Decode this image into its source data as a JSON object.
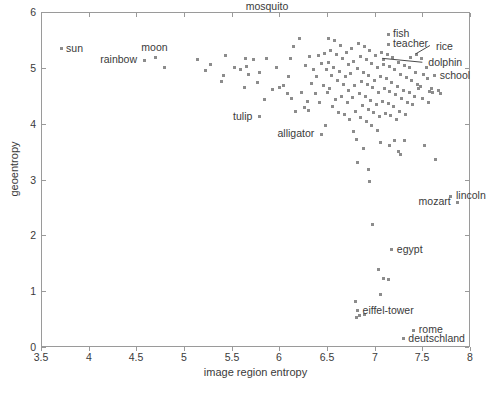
{
  "chart_data": {
    "type": "scatter",
    "title": "",
    "xlabel": "image region entropy",
    "ylabel": "geoentropy",
    "xlim": [
      3.5,
      8.0
    ],
    "ylim": [
      0,
      6
    ],
    "xticks": [
      3.5,
      4,
      4.5,
      5,
      5.5,
      6,
      6.5,
      7,
      7.5,
      8
    ],
    "xticklabels": [
      "3.5",
      "4",
      "4.5",
      "5",
      "5.5",
      "6",
      "6.5",
      "7",
      "7.5",
      "8"
    ],
    "yticks": [
      0,
      1,
      2,
      3,
      4,
      5,
      6
    ],
    "yticklabels": [
      "0",
      "1",
      "2",
      "3",
      "4",
      "5",
      "6"
    ],
    "grid": false,
    "legend": null,
    "marker": "square",
    "marker_color": "#8c8c8c",
    "marker_size_px": 3,
    "annotations": [
      {
        "label": "sun",
        "x": 3.7,
        "y": 5.36,
        "placement": "right"
      },
      {
        "label": "rainbow",
        "x": 4.57,
        "y": 5.15,
        "placement": "left"
      },
      {
        "label": "moon",
        "x": 4.69,
        "y": 5.21,
        "placement": "above"
      },
      {
        "label": "mosquito",
        "x": 5.87,
        "y": 5.95,
        "placement": "above"
      },
      {
        "label": "tulip",
        "x": 5.78,
        "y": 4.14,
        "placement": "left"
      },
      {
        "label": "alligator",
        "x": 6.43,
        "y": 3.83,
        "placement": "left"
      },
      {
        "label": "fish",
        "x": 7.13,
        "y": 5.62,
        "placement": "right"
      },
      {
        "label": "teacher",
        "x": 7.13,
        "y": 5.44,
        "placement": "right"
      },
      {
        "label": "rice",
        "x": 7.43,
        "y": 5.25,
        "placement": "leader"
      },
      {
        "label": "dolphin",
        "x": 7.07,
        "y": 5.16,
        "placement": "leader"
      },
      {
        "label": "school",
        "x": 7.62,
        "y": 4.88,
        "placement": "right"
      },
      {
        "label": "lincoln",
        "x": 7.79,
        "y": 2.72,
        "placement": "right"
      },
      {
        "label": "mozart",
        "x": 7.86,
        "y": 2.61,
        "placement": "left"
      },
      {
        "label": "egypt",
        "x": 7.17,
        "y": 1.76,
        "placement": "right"
      },
      {
        "label": "eiffel-tower",
        "x": 6.81,
        "y": 0.67,
        "placement": "right"
      },
      {
        "label": "deutschland",
        "x": 7.29,
        "y": 0.17,
        "placement": "right"
      },
      {
        "label": "rome",
        "x": 7.4,
        "y": 0.32,
        "placement": "right"
      }
    ],
    "leader_lines": [
      {
        "label": "rice",
        "from_x": 7.58,
        "from_y": 5.4,
        "to_x": 7.43,
        "to_y": 5.25
      },
      {
        "label": "dolphin",
        "from_x": 7.5,
        "from_y": 5.1,
        "to_x": 7.08,
        "to_y": 5.17
      }
    ],
    "points": [
      [
        3.7,
        5.36
      ],
      [
        4.57,
        5.15
      ],
      [
        4.69,
        5.21
      ],
      [
        4.78,
        5.02
      ],
      [
        5.13,
        5.17
      ],
      [
        5.22,
        4.97
      ],
      [
        5.27,
        5.07
      ],
      [
        5.43,
        5.23
      ],
      [
        5.4,
        4.88
      ],
      [
        5.38,
        4.77
      ],
      [
        5.52,
        5.02
      ],
      [
        5.58,
        4.98
      ],
      [
        5.63,
        5.19
      ],
      [
        5.67,
        4.9
      ],
      [
        5.65,
        5.05
      ],
      [
        5.62,
        4.67
      ],
      [
        5.72,
        5.16
      ],
      [
        5.78,
        4.93
      ],
      [
        5.76,
        4.76
      ],
      [
        5.78,
        4.14
      ],
      [
        5.85,
        5.18
      ],
      [
        5.83,
        4.45
      ],
      [
        5.92,
        4.63
      ],
      [
        5.96,
        5.03
      ],
      [
        5.99,
        4.67
      ],
      [
        6.03,
        4.7
      ],
      [
        6.07,
        4.55
      ],
      [
        6.11,
        5.18
      ],
      [
        6.09,
        4.86
      ],
      [
        6.14,
        5.4
      ],
      [
        6.12,
        4.47
      ],
      [
        6.16,
        4.24
      ],
      [
        6.2,
        5.55
      ],
      [
        6.22,
        4.58
      ],
      [
        6.25,
        4.31
      ],
      [
        6.26,
        5.06
      ],
      [
        6.29,
        4.42
      ],
      [
        6.31,
        5.22
      ],
      [
        6.33,
        4.73
      ],
      [
        6.3,
        4.26
      ],
      [
        6.35,
        4.98
      ],
      [
        6.37,
        4.55
      ],
      [
        6.4,
        5.23
      ],
      [
        6.38,
        4.86
      ],
      [
        6.43,
        5.1
      ],
      [
        6.41,
        4.4
      ],
      [
        6.43,
        3.83
      ],
      [
        6.46,
        5.28
      ],
      [
        6.48,
        4.98
      ],
      [
        6.45,
        4.71
      ],
      [
        6.49,
        4.58
      ],
      [
        6.47,
        3.98
      ],
      [
        6.51,
        5.55
      ],
      [
        6.53,
        5.33
      ],
      [
        6.5,
        5.12
      ],
      [
        6.54,
        4.88
      ],
      [
        6.52,
        4.64
      ],
      [
        6.55,
        4.33
      ],
      [
        6.57,
        5.5
      ],
      [
        6.59,
        5.26
      ],
      [
        6.56,
        5.03
      ],
      [
        6.6,
        4.79
      ],
      [
        6.58,
        4.45
      ],
      [
        6.61,
        4.22
      ],
      [
        6.63,
        5.42
      ],
      [
        6.65,
        5.18
      ],
      [
        6.62,
        4.96
      ],
      [
        6.66,
        4.72
      ],
      [
        6.64,
        4.5
      ],
      [
        6.67,
        4.18
      ],
      [
        6.69,
        5.3
      ],
      [
        6.71,
        5.08
      ],
      [
        6.68,
        4.86
      ],
      [
        6.72,
        4.62
      ],
      [
        6.7,
        4.4
      ],
      [
        6.73,
        4.09
      ],
      [
        6.75,
        5.37
      ],
      [
        6.77,
        5.14
      ],
      [
        6.74,
        4.92
      ],
      [
        6.78,
        4.7
      ],
      [
        6.76,
        4.48
      ],
      [
        6.79,
        4.24
      ],
      [
        6.77,
        3.88
      ],
      [
        6.8,
        3.74
      ],
      [
        6.81,
        3.33
      ],
      [
        6.82,
        5.45
      ],
      [
        6.84,
        5.22
      ],
      [
        6.81,
        5.0
      ],
      [
        6.85,
        4.78
      ],
      [
        6.83,
        4.56
      ],
      [
        6.86,
        4.34
      ],
      [
        6.84,
        4.12
      ],
      [
        6.87,
        3.57
      ],
      [
        6.88,
        5.4
      ],
      [
        6.9,
        5.16
      ],
      [
        6.87,
        4.94
      ],
      [
        6.91,
        4.72
      ],
      [
        6.89,
        4.5
      ],
      [
        6.92,
        4.28
      ],
      [
        6.9,
        4.06
      ],
      [
        6.93,
        3.2
      ],
      [
        6.94,
        5.33
      ],
      [
        6.96,
        5.1
      ],
      [
        6.93,
        4.88
      ],
      [
        6.97,
        4.66
      ],
      [
        6.95,
        4.44
      ],
      [
        6.98,
        4.22
      ],
      [
        6.96,
        3.98
      ],
      [
        6.94,
        2.98
      ],
      [
        7.0,
        5.24
      ],
      [
        7.02,
        5.02
      ],
      [
        6.99,
        4.8
      ],
      [
        7.03,
        4.58
      ],
      [
        7.01,
        4.36
      ],
      [
        7.04,
        4.14
      ],
      [
        7.02,
        3.9
      ],
      [
        7.05,
        3.68
      ],
      [
        7.06,
        5.3
      ],
      [
        7.08,
        5.08
      ],
      [
        7.05,
        4.86
      ],
      [
        7.09,
        4.64
      ],
      [
        7.07,
        4.42
      ],
      [
        7.1,
        4.2
      ],
      [
        7.08,
        5.16
      ],
      [
        7.12,
        5.26
      ],
      [
        7.14,
        5.04
      ],
      [
        7.11,
        4.82
      ],
      [
        7.15,
        4.6
      ],
      [
        7.13,
        4.38
      ],
      [
        7.16,
        4.16
      ],
      [
        7.13,
        5.62
      ],
      [
        7.13,
        5.44
      ],
      [
        7.14,
        3.62
      ],
      [
        7.18,
        5.2
      ],
      [
        7.2,
        4.98
      ],
      [
        7.17,
        4.76
      ],
      [
        7.21,
        4.54
      ],
      [
        7.19,
        4.32
      ],
      [
        7.22,
        4.1
      ],
      [
        7.17,
        1.76
      ],
      [
        7.2,
        3.72
      ],
      [
        7.24,
        5.12
      ],
      [
        7.26,
        4.9
      ],
      [
        7.23,
        4.68
      ],
      [
        7.27,
        4.46
      ],
      [
        7.25,
        4.24
      ],
      [
        7.24,
        3.52
      ],
      [
        7.26,
        3.46
      ],
      [
        7.3,
        5.06
      ],
      [
        7.32,
        4.84
      ],
      [
        7.29,
        4.62
      ],
      [
        7.33,
        4.4
      ],
      [
        7.31,
        4.18
      ],
      [
        7.3,
        3.71
      ],
      [
        7.36,
        5.02
      ],
      [
        7.38,
        4.8
      ],
      [
        7.35,
        4.58
      ],
      [
        7.39,
        4.36
      ],
      [
        7.37,
        5.2
      ],
      [
        7.42,
        4.94
      ],
      [
        7.44,
        4.72
      ],
      [
        7.41,
        4.5
      ],
      [
        7.43,
        5.25
      ],
      [
        7.45,
        4.64
      ],
      [
        7.48,
        5.18
      ],
      [
        7.5,
        4.9
      ],
      [
        7.47,
        4.68
      ],
      [
        7.49,
        4.46
      ],
      [
        7.51,
        3.62
      ],
      [
        7.54,
        4.82
      ],
      [
        7.56,
        4.6
      ],
      [
        7.53,
        5.02
      ],
      [
        7.55,
        4.4
      ],
      [
        7.59,
        4.64
      ],
      [
        7.62,
        4.88
      ],
      [
        7.6,
        4.58
      ],
      [
        7.63,
        3.38
      ],
      [
        7.66,
        4.62
      ],
      [
        7.68,
        4.55
      ],
      [
        6.79,
        0.83
      ],
      [
        6.81,
        0.67
      ],
      [
        6.8,
        0.55
      ],
      [
        6.88,
        0.6
      ],
      [
        6.83,
        0.58
      ],
      [
        7.03,
        1.41
      ],
      [
        7.08,
        1.24
      ],
      [
        7.05,
        0.96
      ],
      [
        7.13,
        1.22
      ],
      [
        6.97,
        2.21
      ],
      [
        7.29,
        0.17
      ],
      [
        7.4,
        0.32
      ],
      [
        7.79,
        2.72
      ],
      [
        7.86,
        2.61
      ]
    ]
  }
}
